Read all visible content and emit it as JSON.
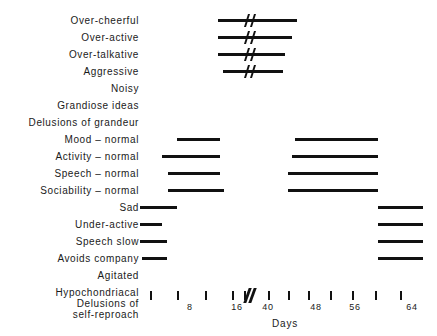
{
  "chart_data": {
    "type": "bar",
    "title": "",
    "subtitle": "",
    "xlabel": "Days",
    "ylabel": "",
    "grid": false,
    "legend": null,
    "axis": {
      "label": "Days",
      "tick_values": [
        4,
        8,
        12,
        16,
        20,
        40,
        44,
        48,
        52,
        56,
        60,
        64
      ],
      "tick_labels": [
        "",
        "8",
        "",
        "16",
        "",
        "40",
        "",
        "48",
        "",
        "56",
        "",
        "64"
      ],
      "break_after": 20,
      "break_before": 40,
      "has_break": true
    },
    "categories": [
      "Over-cheerful",
      "Over-active",
      "Over-talkative",
      "Aggressive",
      "Noisy",
      "Grandiose ideas",
      "Delusions of grandeur",
      "Mood – normal",
      "Activity – normal",
      "Speech – normal",
      "Sociability – normal",
      "Sad",
      "Under-active",
      "Speech slow",
      "Avoids company",
      "Agitated",
      "Hypochondriacal",
      "Delusions of\nself-reproach"
    ],
    "rows": [
      {
        "label": "Over-cheerful",
        "label_lines": [
          "Over-cheerful"
        ],
        "segments": [
          {
            "start_px": 218,
            "end_px": 297,
            "crossed_break": true
          }
        ]
      },
      {
        "label": "Over-active",
        "label_lines": [
          "Over-active"
        ],
        "segments": [
          {
            "start_px": 218,
            "end_px": 292,
            "crossed_break": true
          }
        ]
      },
      {
        "label": "Over-talkative",
        "label_lines": [
          "Over-talkative"
        ],
        "segments": [
          {
            "start_px": 218,
            "end_px": 285,
            "crossed_break": true
          }
        ]
      },
      {
        "label": "Aggressive",
        "label_lines": [
          "Aggressive"
        ],
        "segments": [
          {
            "start_px": 223,
            "end_px": 283,
            "crossed_break": true
          }
        ]
      },
      {
        "label": "Noisy",
        "label_lines": [
          "Noisy"
        ],
        "segments": []
      },
      {
        "label": "Grandiose ideas",
        "label_lines": [
          "Grandiose ideas"
        ],
        "segments": []
      },
      {
        "label": "Delusions of grandeur",
        "label_lines": [
          "Delusions of grandeur"
        ],
        "segments": []
      },
      {
        "label": "Mood – normal",
        "label_lines": [
          "Mood – normal"
        ],
        "segments": [
          {
            "start_px": 177,
            "end_px": 220,
            "crossed_break": false
          },
          {
            "start_px": 295,
            "end_px": 378,
            "crossed_break": false
          }
        ]
      },
      {
        "label": "Activity – normal",
        "label_lines": [
          "Activity – normal"
        ],
        "segments": [
          {
            "start_px": 162,
            "end_px": 220,
            "crossed_break": false
          },
          {
            "start_px": 292,
            "end_px": 378,
            "crossed_break": false
          }
        ]
      },
      {
        "label": "Speech – normal",
        "label_lines": [
          "Speech – normal"
        ],
        "segments": [
          {
            "start_px": 168,
            "end_px": 220,
            "crossed_break": false
          },
          {
            "start_px": 288,
            "end_px": 378,
            "crossed_break": false
          }
        ]
      },
      {
        "label": "Sociability – normal",
        "label_lines": [
          "Sociability – normal"
        ],
        "segments": [
          {
            "start_px": 168,
            "end_px": 224,
            "crossed_break": false
          },
          {
            "start_px": 288,
            "end_px": 378,
            "crossed_break": false
          }
        ]
      },
      {
        "label": "Sad",
        "label_lines": [
          "Sad"
        ],
        "segments": [
          {
            "start_px": 140,
            "end_px": 177,
            "crossed_break": false
          },
          {
            "start_px": 378,
            "end_px": 423,
            "crossed_break": false
          }
        ]
      },
      {
        "label": "Under-active",
        "label_lines": [
          "Under-active"
        ],
        "segments": [
          {
            "start_px": 140,
            "end_px": 162,
            "crossed_break": false
          },
          {
            "start_px": 378,
            "end_px": 423,
            "crossed_break": false
          }
        ]
      },
      {
        "label": "Speech slow",
        "label_lines": [
          "Speech slow"
        ],
        "segments": [
          {
            "start_px": 140,
            "end_px": 167,
            "crossed_break": false
          },
          {
            "start_px": 378,
            "end_px": 423,
            "crossed_break": false
          }
        ]
      },
      {
        "label": "Avoids company",
        "label_lines": [
          "Avoids company"
        ],
        "segments": [
          {
            "start_px": 142,
            "end_px": 167,
            "crossed_break": false
          },
          {
            "start_px": 378,
            "end_px": 423,
            "crossed_break": false
          }
        ]
      },
      {
        "label": "Agitated",
        "label_lines": [
          "Agitated"
        ],
        "segments": []
      },
      {
        "label": "Hypochondriacal",
        "label_lines": [
          "Hypochondriacal"
        ],
        "segments": []
      },
      {
        "label": "Delusions of self-reproach",
        "label_lines": [
          "Delusions of",
          "self-reproach"
        ],
        "segments": []
      }
    ],
    "colors": {
      "bar": "#111111",
      "text": "#1a1a1a",
      "background": "#ffffff"
    }
  },
  "layout": {
    "row_start_y": 20,
    "row_step_y": 17,
    "axis_y": 291,
    "break_x": 250,
    "tick_positions_px": [
      150,
      177,
      205,
      232,
      244,
      268,
      288,
      308,
      330,
      352,
      375,
      400
    ],
    "tick_label_positions_px": [
      150,
      190,
      205,
      237,
      244,
      268,
      288,
      316,
      330,
      355,
      375,
      412
    ],
    "axis_title_x": 285,
    "axis_title_y": 318
  }
}
